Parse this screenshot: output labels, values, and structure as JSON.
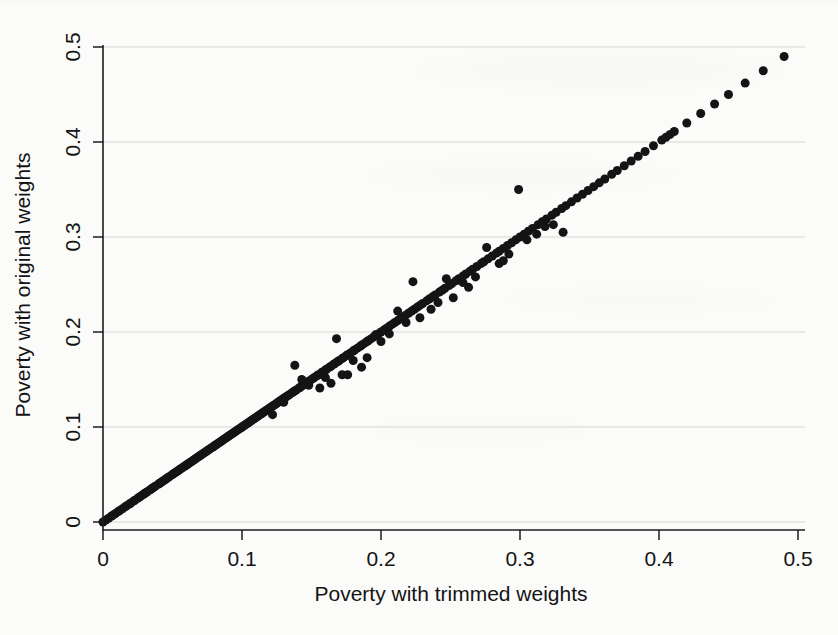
{
  "figure": {
    "kind": "scatter-plot",
    "background_color": "#fbfbf9",
    "point_color": "#141414",
    "grid_color": "#d7d7d7",
    "axis_color": "#1c1c1c"
  },
  "chart_data": {
    "type": "scatter",
    "title": "",
    "xlabel": "Poverty with trimmed weights",
    "ylabel": "Poverty with original weights",
    "xlim": [
      0,
      0.5
    ],
    "ylim": [
      0,
      0.5
    ],
    "xticks": [
      0,
      0.1,
      0.2,
      0.3,
      0.4,
      0.5
    ],
    "yticks": [
      0,
      0.1,
      0.2,
      0.3,
      0.4,
      0.5
    ],
    "xtick_labels": [
      "0",
      "0.1",
      "0.2",
      "0.3",
      "0.4",
      "0.5"
    ],
    "ytick_labels": [
      "0",
      "0.1",
      "0.2",
      "0.3",
      "0.4",
      "0.5"
    ],
    "grid": "horizontal",
    "legend": "none",
    "marker": "filled-circle",
    "marker_size": 9,
    "x": [
      0.0,
      0.002,
      0.004,
      0.006,
      0.007,
      0.009,
      0.011,
      0.012,
      0.014,
      0.016,
      0.017,
      0.019,
      0.02,
      0.022,
      0.023,
      0.025,
      0.026,
      0.027,
      0.029,
      0.03,
      0.031,
      0.032,
      0.034,
      0.035,
      0.036,
      0.037,
      0.038,
      0.04,
      0.041,
      0.042,
      0.043,
      0.044,
      0.045,
      0.046,
      0.047,
      0.048,
      0.05,
      0.051,
      0.052,
      0.053,
      0.054,
      0.055,
      0.056,
      0.057,
      0.058,
      0.059,
      0.06,
      0.061,
      0.062,
      0.063,
      0.064,
      0.065,
      0.066,
      0.067,
      0.068,
      0.069,
      0.07,
      0.071,
      0.072,
      0.073,
      0.074,
      0.075,
      0.076,
      0.077,
      0.078,
      0.079,
      0.08,
      0.081,
      0.082,
      0.083,
      0.084,
      0.085,
      0.086,
      0.087,
      0.088,
      0.089,
      0.09,
      0.091,
      0.092,
      0.093,
      0.094,
      0.095,
      0.096,
      0.097,
      0.098,
      0.099,
      0.1,
      0.101,
      0.102,
      0.103,
      0.104,
      0.105,
      0.106,
      0.107,
      0.108,
      0.109,
      0.11,
      0.111,
      0.112,
      0.113,
      0.114,
      0.115,
      0.116,
      0.117,
      0.118,
      0.119,
      0.12,
      0.121,
      0.122,
      0.123,
      0.124,
      0.125,
      0.126,
      0.127,
      0.128,
      0.129,
      0.13,
      0.131,
      0.132,
      0.133,
      0.134,
      0.136,
      0.137,
      0.138,
      0.139,
      0.141,
      0.142,
      0.143,
      0.145,
      0.146,
      0.148,
      0.149,
      0.151,
      0.152,
      0.154,
      0.155,
      0.157,
      0.158,
      0.16,
      0.161,
      0.163,
      0.164,
      0.166,
      0.167,
      0.169,
      0.17,
      0.172,
      0.173,
      0.175,
      0.176,
      0.178,
      0.18,
      0.181,
      0.183,
      0.185,
      0.186,
      0.188,
      0.19,
      0.191,
      0.193,
      0.195,
      0.197,
      0.198,
      0.2,
      0.202,
      0.204,
      0.206,
      0.208,
      0.21,
      0.212,
      0.214,
      0.216,
      0.218,
      0.22,
      0.222,
      0.224,
      0.226,
      0.228,
      0.23,
      0.233,
      0.235,
      0.237,
      0.239,
      0.242,
      0.244,
      0.246,
      0.249,
      0.251,
      0.254,
      0.256,
      0.259,
      0.261,
      0.264,
      0.266,
      0.269,
      0.272,
      0.274,
      0.277,
      0.28,
      0.283,
      0.285,
      0.288,
      0.291,
      0.294,
      0.297,
      0.3,
      0.303,
      0.306,
      0.309,
      0.313,
      0.316,
      0.319,
      0.323,
      0.326,
      0.33,
      0.333,
      0.337,
      0.341,
      0.345,
      0.349,
      0.353,
      0.357,
      0.361,
      0.366,
      0.37,
      0.375,
      0.38,
      0.385,
      0.39,
      0.396,
      0.402,
      0.405,
      0.408,
      0.411,
      0.42,
      0.43,
      0.44,
      0.45,
      0.462,
      0.475,
      0.49,
      0.138,
      0.143,
      0.156,
      0.168,
      0.172,
      0.176,
      0.186,
      0.19,
      0.196,
      0.206,
      0.212,
      0.218,
      0.223,
      0.241,
      0.247,
      0.252,
      0.259,
      0.268,
      0.276,
      0.285,
      0.292,
      0.299,
      0.305,
      0.312,
      0.318,
      0.331,
      0.122,
      0.13,
      0.148,
      0.16,
      0.164,
      0.18,
      0.2,
      0.228,
      0.236,
      0.263,
      0.288,
      0.324
    ],
    "y": [
      0.0,
      0.002,
      0.004,
      0.006,
      0.007,
      0.009,
      0.011,
      0.012,
      0.014,
      0.016,
      0.017,
      0.019,
      0.02,
      0.022,
      0.023,
      0.025,
      0.026,
      0.027,
      0.029,
      0.03,
      0.031,
      0.032,
      0.034,
      0.035,
      0.036,
      0.037,
      0.038,
      0.04,
      0.041,
      0.042,
      0.043,
      0.044,
      0.045,
      0.046,
      0.047,
      0.048,
      0.05,
      0.051,
      0.052,
      0.053,
      0.054,
      0.055,
      0.056,
      0.057,
      0.058,
      0.059,
      0.06,
      0.061,
      0.062,
      0.063,
      0.064,
      0.065,
      0.066,
      0.067,
      0.068,
      0.069,
      0.07,
      0.071,
      0.072,
      0.073,
      0.074,
      0.075,
      0.076,
      0.077,
      0.078,
      0.079,
      0.08,
      0.081,
      0.082,
      0.083,
      0.084,
      0.085,
      0.086,
      0.087,
      0.088,
      0.089,
      0.09,
      0.091,
      0.092,
      0.093,
      0.094,
      0.095,
      0.096,
      0.097,
      0.098,
      0.099,
      0.1,
      0.101,
      0.102,
      0.103,
      0.104,
      0.105,
      0.106,
      0.107,
      0.108,
      0.109,
      0.11,
      0.111,
      0.112,
      0.113,
      0.114,
      0.115,
      0.116,
      0.117,
      0.118,
      0.119,
      0.12,
      0.121,
      0.122,
      0.123,
      0.124,
      0.125,
      0.126,
      0.127,
      0.128,
      0.129,
      0.13,
      0.131,
      0.132,
      0.133,
      0.134,
      0.136,
      0.137,
      0.138,
      0.139,
      0.141,
      0.142,
      0.143,
      0.145,
      0.146,
      0.148,
      0.149,
      0.151,
      0.152,
      0.154,
      0.155,
      0.157,
      0.158,
      0.16,
      0.161,
      0.163,
      0.164,
      0.166,
      0.167,
      0.169,
      0.17,
      0.172,
      0.173,
      0.175,
      0.176,
      0.178,
      0.18,
      0.181,
      0.183,
      0.185,
      0.186,
      0.188,
      0.19,
      0.191,
      0.193,
      0.195,
      0.197,
      0.198,
      0.2,
      0.202,
      0.204,
      0.206,
      0.208,
      0.21,
      0.212,
      0.214,
      0.216,
      0.218,
      0.22,
      0.222,
      0.224,
      0.226,
      0.228,
      0.23,
      0.233,
      0.235,
      0.237,
      0.239,
      0.242,
      0.244,
      0.246,
      0.249,
      0.251,
      0.254,
      0.256,
      0.259,
      0.261,
      0.264,
      0.266,
      0.269,
      0.272,
      0.274,
      0.277,
      0.28,
      0.283,
      0.285,
      0.288,
      0.291,
      0.294,
      0.297,
      0.3,
      0.303,
      0.306,
      0.309,
      0.313,
      0.316,
      0.319,
      0.323,
      0.326,
      0.33,
      0.333,
      0.337,
      0.341,
      0.345,
      0.349,
      0.353,
      0.357,
      0.361,
      0.366,
      0.37,
      0.375,
      0.38,
      0.385,
      0.39,
      0.396,
      0.402,
      0.405,
      0.408,
      0.411,
      0.42,
      0.43,
      0.44,
      0.45,
      0.462,
      0.475,
      0.49,
      0.165,
      0.15,
      0.141,
      0.193,
      0.155,
      0.155,
      0.163,
      0.173,
      0.197,
      0.198,
      0.222,
      0.21,
      0.253,
      0.231,
      0.256,
      0.236,
      0.252,
      0.258,
      0.289,
      0.272,
      0.282,
      0.35,
      0.297,
      0.303,
      0.311,
      0.305,
      0.113,
      0.126,
      0.144,
      0.152,
      0.146,
      0.17,
      0.19,
      0.215,
      0.224,
      0.247,
      0.275,
      0.313
    ]
  }
}
